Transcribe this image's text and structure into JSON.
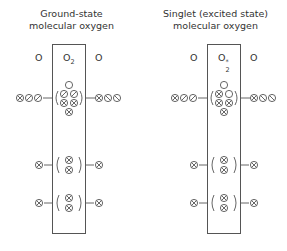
{
  "diagrams": [
    {
      "title_line1": "Ground-state",
      "title_line2": "molecular oxygen",
      "left_atom_label": "O",
      "molecule_label": "O",
      "molecule_subscript": "2",
      "molecule_superscript": "",
      "right_atom_label": "O",
      "outer_orbitals": {
        "left_atom": [
          "paired",
          "up",
          "up"
        ],
        "right_atom": [
          "paired",
          "down",
          "down"
        ],
        "molecule": {
          "top": [
            "empty"
          ],
          "row2": [
            "up",
            "up"
          ],
          "row3": [
            "paired",
            "paired"
          ],
          "row4": [
            "paired"
          ]
        }
      },
      "inner_orbitals_1": {
        "left_atom": "paired",
        "molecule": [
          "paired",
          "paired"
        ],
        "right_atom": "paired"
      },
      "inner_orbitals_2": {
        "left_atom": "paired",
        "molecule": [
          "paired",
          "paired"
        ],
        "right_atom": "paired"
      }
    },
    {
      "title_line1": "Singlet (excited state)",
      "title_line2": "molecular oxygen",
      "left_atom_label": "O",
      "molecule_label": "O",
      "molecule_subscript": "2",
      "molecule_superscript": "*",
      "right_atom_label": "O",
      "outer_orbitals": {
        "left_atom": [
          "paired",
          "up",
          "up"
        ],
        "right_atom": [
          "paired",
          "down",
          "down"
        ],
        "molecule": {
          "top": [
            "empty"
          ],
          "row2": [
            "paired",
            "empty"
          ],
          "row3": [
            "paired",
            "paired"
          ],
          "row4": [
            "paired"
          ]
        }
      },
      "inner_orbitals_1": {
        "left_atom": "paired",
        "molecule": [
          "paired",
          "paired"
        ],
        "right_atom": "paired"
      },
      "inner_orbitals_2": {
        "left_atom": "paired",
        "molecule": [
          "paired",
          "paired"
        ],
        "right_atom": "paired"
      }
    }
  ],
  "legend_symbols": {
    "paired": "⊗ circle with X (paired electrons)",
    "up": "⊘ circle with forward slash (single electron)",
    "down": "⦸ circle with back slash (single electron, opposite spin)",
    "empty": "○ empty orbital"
  }
}
